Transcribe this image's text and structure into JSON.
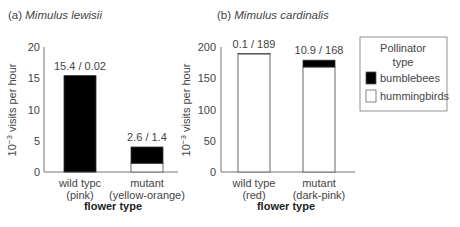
{
  "chart_data": [
    {
      "type": "bar",
      "stacked": true,
      "title_prefix": "(a)",
      "title_species": "Mimulus lewisii",
      "ylabel_base": "10",
      "ylabel_exp": "−3",
      "ylabel_rest": " visits per hour",
      "xlabel": "flower type",
      "ylim": [
        0,
        20
      ],
      "yticks": [
        "0",
        "5",
        "10",
        "15",
        "20"
      ],
      "ytick_values": [
        0,
        5,
        10,
        15,
        20
      ],
      "categories": [
        {
          "line1": "wild typc",
          "line2": "(pink)"
        },
        {
          "line1": "mutant",
          "line2": "(yellow-orange)"
        }
      ],
      "series": [
        {
          "name": "hummingbirds",
          "values": [
            0.02,
            1.4
          ]
        },
        {
          "name": "bumblebees",
          "values": [
            15.4,
            2.6
          ]
        }
      ],
      "data_labels": [
        "15.4 / 0.02",
        "2.6 / 1.4"
      ],
      "grid": false
    },
    {
      "type": "bar",
      "stacked": true,
      "title_prefix": "(b)",
      "title_species": "Mimulus cardinalis",
      "ylabel_base": "10",
      "ylabel_exp": "−3",
      "ylabel_rest": " visits per hour",
      "xlabel": "flower type",
      "ylim": [
        0,
        200
      ],
      "yticks": [
        "0",
        "50",
        "100",
        "150",
        "200"
      ],
      "ytick_values": [
        0,
        50,
        100,
        150,
        200
      ],
      "categories": [
        {
          "line1": "wild type",
          "line2": "(red)"
        },
        {
          "line1": "mutant",
          "line2": "(dark-pink)"
        }
      ],
      "series": [
        {
          "name": "hummingbirds",
          "values": [
            189,
            168
          ]
        },
        {
          "name": "bumblebees",
          "values": [
            0.1,
            10.9
          ]
        }
      ],
      "data_labels": [
        "0.1 / 189",
        "10.9 / 168"
      ],
      "grid": false
    }
  ],
  "legend": {
    "title_line1": "Pollinator",
    "title_line2": "type",
    "position": "right",
    "items": [
      {
        "label": "bumblebees",
        "color": "#000000"
      },
      {
        "label": "hummingbirds",
        "color": "#ffffff"
      }
    ]
  },
  "colors": {
    "bumblebees": "#000000",
    "hummingbirds": "#ffffff",
    "axis": "#777777"
  }
}
